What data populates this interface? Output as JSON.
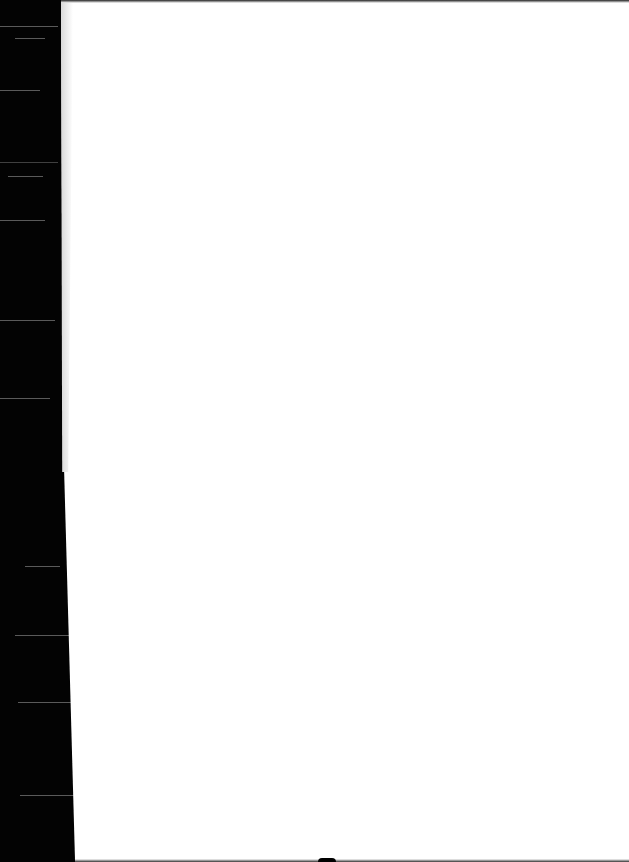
{
  "document": {
    "type": "scanned-blank-page",
    "text": "",
    "colors": {
      "page": "#ffffff",
      "background": "#000000"
    }
  }
}
